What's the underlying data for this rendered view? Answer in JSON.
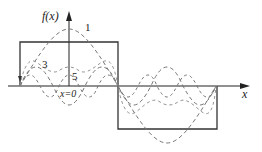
{
  "figure": {
    "axes": {
      "x_label": "x",
      "y_label": "f(x)",
      "origin_label": "x=0"
    },
    "curves": [
      {
        "label": "1",
        "style": "dashed",
        "role": "fundamental harmonic"
      },
      {
        "label": "3",
        "style": "dashed",
        "role": "third harmonic"
      },
      {
        "label": "5",
        "style": "dashed",
        "role": "fifth harmonic"
      }
    ],
    "square_wave": {
      "style": "solid",
      "levels": [
        "high",
        "low"
      ]
    },
    "colors": {
      "axis": "#222222",
      "wave": "#333333",
      "dashed": "#777777"
    }
  }
}
